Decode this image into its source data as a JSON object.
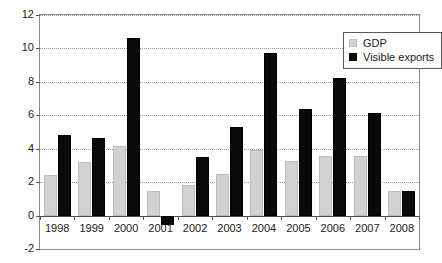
{
  "chart_data": {
    "type": "bar",
    "title": "",
    "subtitle": "",
    "xlabel": "",
    "ylabel": "",
    "categories": [
      "1998",
      "1999",
      "2000",
      "2001",
      "2002",
      "2003",
      "2004",
      "2005",
      "2006",
      "2007",
      "2008"
    ],
    "series": [
      {
        "name": "GDP",
        "color": "#d2d2d2",
        "values": [
          2.45,
          3.2,
          4.15,
          1.45,
          1.85,
          2.5,
          3.9,
          3.25,
          3.55,
          3.55,
          1.5
        ]
      },
      {
        "name": "Visible exports",
        "color": "#0a0a0a",
        "values": [
          4.8,
          4.65,
          10.65,
          -0.55,
          3.5,
          5.3,
          9.75,
          6.4,
          8.25,
          6.15,
          1.45
        ]
      }
    ],
    "ylim": [
      -2,
      12
    ],
    "ytick_values": [
      12,
      10,
      8,
      6,
      4,
      2,
      0,
      -2
    ],
    "ytick_labels": [
      "12",
      "10",
      "8",
      "6",
      "4",
      "2",
      "0",
      "-2"
    ],
    "grid": true,
    "legend_position": "top-right",
    "legend": [
      {
        "label": "GDP",
        "swatch": "gdp"
      },
      {
        "label": "Visible exports",
        "swatch": "exports"
      }
    ]
  }
}
